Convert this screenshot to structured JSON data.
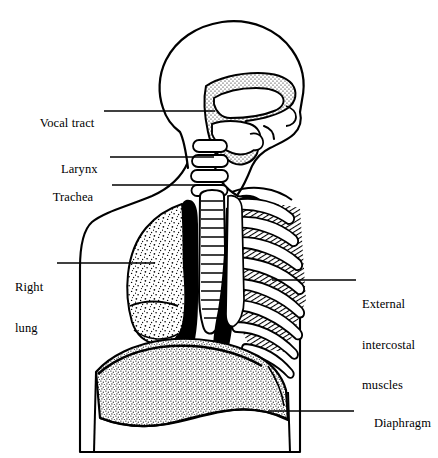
{
  "figure": {
    "background_color": "#ffffff",
    "ink_color": "#000000",
    "style": "black-and-white line engraving with stipple and hatch shading"
  },
  "labels": {
    "vocal_tract": "Vocal tract",
    "larynx": "Larynx",
    "trachea": "Trachea",
    "right_lung_line1": "Right",
    "right_lung_line2": "lung",
    "external_line1": "External",
    "external_line2": "intercostal",
    "external_line3": "muscles",
    "diaphragm": "Diaphragm"
  },
  "anatomy_parts": [
    {
      "name": "vocal-tract",
      "label": "Vocal tract",
      "side": "left",
      "shading": "stipple",
      "leader_line": {
        "x1": 104,
        "y1": 111,
        "x2": 215,
        "y2": 111
      },
      "text_position": {
        "x": 27,
        "y": 104
      }
    },
    {
      "name": "larynx",
      "label": "Larynx",
      "side": "left",
      "shading": "outline",
      "leader_line": {
        "x1": 110,
        "y1": 157,
        "x2": 214,
        "y2": 157
      },
      "text_position": {
        "x": 48,
        "y": 150
      }
    },
    {
      "name": "trachea",
      "label": "Trachea",
      "side": "left",
      "shading": "outline",
      "leader_line": {
        "x1": 112,
        "y1": 185,
        "x2": 212,
        "y2": 185
      },
      "text_position": {
        "x": 40,
        "y": 178
      }
    },
    {
      "name": "right-lung",
      "label": "Right lung",
      "side": "left",
      "shading": "stipple",
      "leader_line": {
        "x1": 57,
        "y1": 263,
        "x2": 155,
        "y2": 263
      },
      "text_position": {
        "x": 15,
        "y": 255
      }
    },
    {
      "name": "external-intercostal-muscles",
      "label": "External intercostal muscles",
      "side": "right",
      "shading": "diagonal-hatch",
      "leader_line": {
        "x1": 272,
        "y1": 280,
        "x2": 356,
        "y2": 280
      },
      "text_position": {
        "x": 362,
        "y": 272
      }
    },
    {
      "name": "diaphragm",
      "label": "Diaphragm",
      "side": "right",
      "shading": "dense-stipple",
      "leader_line": {
        "x1": 268,
        "y1": 411,
        "x2": 354,
        "y2": 411
      },
      "text_position": {
        "x": 361,
        "y": 404
      }
    }
  ]
}
